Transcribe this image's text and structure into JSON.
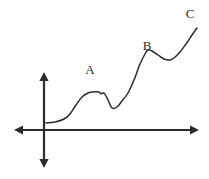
{
  "figure": {
    "width": 209,
    "height": 179,
    "background_color": "#ffffff",
    "style": "hand-drawn line figure on plain white background",
    "line_color": "#2b2b2b",
    "axis_color": "#2b2b2b",
    "curve_color": "#2b2b2b",
    "axis_stroke_width": 2.2,
    "curve_stroke_width": 1.5
  },
  "axes": {
    "horizontal": {
      "name": "x-axis",
      "y": 130,
      "x_start": 14,
      "x_end": 199,
      "arrowheads": "both"
    },
    "vertical": {
      "name": "y-axis",
      "x": 44,
      "y_top": 72,
      "y_bottom": 168,
      "arrowheads": "both"
    },
    "origin": {
      "x": 44,
      "y": 130
    }
  },
  "labels": [
    {
      "text": "A",
      "x": 90,
      "y": 71
    },
    {
      "text": "B",
      "x": 147,
      "y": 47
    },
    {
      "text": "C",
      "x": 190,
      "y": 15
    }
  ],
  "chart_data": {
    "type": "line",
    "title": "",
    "xlabel": "",
    "ylabel": "",
    "grid": false,
    "legend": false,
    "annotations": [
      "A",
      "B",
      "C"
    ],
    "x_pixels": [
      46,
      55,
      64,
      70,
      76,
      82,
      88,
      94,
      99,
      101,
      104,
      108,
      112,
      117,
      122,
      128,
      134,
      140,
      145,
      148,
      152,
      158,
      164,
      170,
      174,
      180,
      186,
      192,
      197
    ],
    "y_pixels": [
      123,
      122,
      119,
      114,
      105,
      97,
      93,
      92,
      92,
      94,
      93,
      100,
      108,
      107,
      101,
      93,
      80,
      64,
      54,
      50,
      51,
      55,
      59,
      60,
      58,
      52,
      44,
      35,
      28
    ],
    "series": [
      {
        "name": "curve",
        "points": [
          {
            "x": 46,
            "y": 123
          },
          {
            "x": 55,
            "y": 122
          },
          {
            "x": 64,
            "y": 119
          },
          {
            "x": 70,
            "y": 114
          },
          {
            "x": 76,
            "y": 105
          },
          {
            "x": 82,
            "y": 97
          },
          {
            "x": 88,
            "y": 93
          },
          {
            "x": 94,
            "y": 92
          },
          {
            "x": 99,
            "y": 92
          },
          {
            "x": 101,
            "y": 94
          },
          {
            "x": 104,
            "y": 93
          },
          {
            "x": 108,
            "y": 100
          },
          {
            "x": 112,
            "y": 108
          },
          {
            "x": 117,
            "y": 107
          },
          {
            "x": 122,
            "y": 101
          },
          {
            "x": 128,
            "y": 93
          },
          {
            "x": 134,
            "y": 80
          },
          {
            "x": 140,
            "y": 64
          },
          {
            "x": 145,
            "y": 54
          },
          {
            "x": 148,
            "y": 50
          },
          {
            "x": 152,
            "y": 51
          },
          {
            "x": 158,
            "y": 55
          },
          {
            "x": 164,
            "y": 59
          },
          {
            "x": 170,
            "y": 60
          },
          {
            "x": 174,
            "y": 58
          },
          {
            "x": 180,
            "y": 52
          },
          {
            "x": 186,
            "y": 44
          },
          {
            "x": 192,
            "y": 35
          },
          {
            "x": 197,
            "y": 28
          }
        ]
      }
    ],
    "features": [
      {
        "name": "start-flat",
        "x": 46,
        "y": 123
      },
      {
        "name": "plateau-A",
        "x": 95,
        "y": 92
      },
      {
        "name": "notch-A",
        "x": 101,
        "y": 94
      },
      {
        "name": "dip-after-A",
        "x": 112,
        "y": 108
      },
      {
        "name": "peak-B",
        "x": 148,
        "y": 50
      },
      {
        "name": "dip-after-B",
        "x": 171,
        "y": 60
      },
      {
        "name": "end-rise-C",
        "x": 197,
        "y": 28
      }
    ]
  }
}
